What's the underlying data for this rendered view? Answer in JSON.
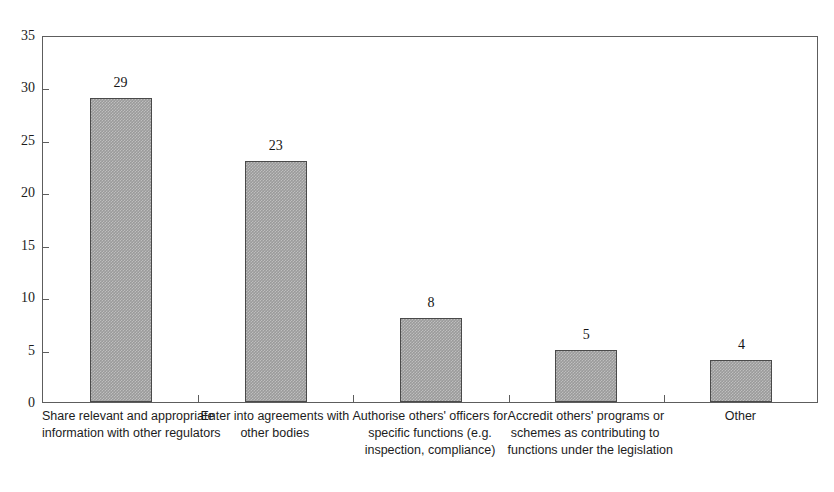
{
  "page": {
    "scan_remnant_text": "· · · · · · · · · · · · · · · · · · · · · · · · ·"
  },
  "chart_data": {
    "type": "bar",
    "title": "",
    "subtitle": "",
    "xlabel": "",
    "ylabel": "",
    "ylim": [
      0,
      35
    ],
    "ytick_values": [
      0,
      5,
      10,
      15,
      20,
      25,
      30,
      35
    ],
    "ytick_labels": [
      "0",
      "5",
      "10",
      "15",
      "20",
      "25",
      "30",
      "35"
    ],
    "grid": false,
    "legend": false,
    "legend_position": "none",
    "bar_color": "#9a9a9a",
    "bar_edge_color": "#4a4a4a",
    "axis_color": "#5d5d5d",
    "background_color": "#ffffff",
    "show_value_labels": true,
    "categories": [
      "Share relevant and appropriate information with other regulators",
      "Enter into agreements with other bodies",
      "Authorise others' officers for specific functions (e.g. inspection, compliance)",
      "Accredit others' programs or schemes as contributing to functions under the legislation",
      "Other"
    ],
    "category_label_lines": [
      [
        "Share relevant and appropriate",
        "information with other regulators"
      ],
      [
        "Enter into agreements with",
        "other bodies"
      ],
      [
        "Authorise others' officers for",
        "specific functions (e.g.",
        "inspection, compliance)"
      ],
      [
        "Accredit others' programs or",
        "schemes as contributing to",
        "functions under the legislation"
      ],
      [
        "Other"
      ]
    ],
    "values": [
      29,
      23,
      8,
      5,
      4
    ],
    "value_labels": [
      "29",
      "23",
      "8",
      "5",
      "4"
    ]
  }
}
